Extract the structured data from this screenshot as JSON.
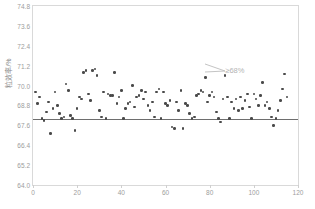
{
  "chart_data": {
    "type": "scatter",
    "title": "",
    "xlabel": "",
    "ylabel": "粒效率/%",
    "xlim": [
      0,
      120
    ],
    "ylim": [
      64.0,
      74.8
    ],
    "grid": false,
    "legend": null,
    "x_ticks": [
      "0",
      "20",
      "40",
      "60",
      "80",
      "100",
      "120"
    ],
    "x_tick_values": [
      0,
      20,
      40,
      60,
      80,
      100,
      120
    ],
    "y_ticks": [
      "64.0",
      "65.2",
      "66.4",
      "67.6",
      "68.8",
      "70.0",
      "71.2",
      "72.4",
      "73.6",
      "74.8"
    ],
    "y_tick_values": [
      64.0,
      65.2,
      66.4,
      67.6,
      68.8,
      70.0,
      71.2,
      72.4,
      73.6,
      74.8
    ],
    "reference_line": {
      "value": 68.0,
      "orientation": "horizontal",
      "label": "≥68%",
      "color": "#6e6e6e"
    },
    "annotations": [
      {
        "text": "≥68%",
        "x": 88,
        "y": 71.0
      }
    ],
    "marker_color": "#4a4a4a",
    "x": [
      1,
      2,
      3,
      4,
      5,
      6,
      7,
      8,
      9,
      10,
      11,
      12,
      13,
      14,
      15,
      16,
      17,
      18,
      19,
      20,
      21,
      22,
      23,
      24,
      25,
      26,
      27,
      28,
      29,
      30,
      31,
      32,
      33,
      34,
      35,
      36,
      37,
      38,
      39,
      40,
      41,
      42,
      43,
      44,
      45,
      46,
      47,
      48,
      49,
      50,
      51,
      52,
      53,
      54,
      55,
      56,
      57,
      58,
      59,
      60,
      61,
      62,
      63,
      64,
      65,
      66,
      67,
      68,
      69,
      70,
      71,
      72,
      73,
      74,
      75,
      76,
      77,
      78,
      79,
      80,
      81,
      82,
      83,
      84,
      85,
      86,
      87,
      88,
      89,
      90,
      91,
      92,
      93,
      94,
      95,
      96,
      97,
      98,
      99,
      100,
      101,
      102,
      103,
      104,
      105,
      106,
      107,
      108,
      109,
      110,
      111,
      112,
      113,
      114,
      115
    ],
    "y": [
      69.6,
      68.9,
      69.3,
      68.0,
      67.9,
      68.4,
      69.0,
      67.1,
      68.6,
      69.6,
      68.8,
      68.3,
      68.0,
      68.1,
      70.1,
      69.7,
      68.2,
      68.0,
      67.3,
      68.6,
      69.3,
      69.2,
      70.8,
      70.9,
      69.5,
      69.1,
      70.9,
      71.0,
      70.6,
      68.5,
      68.1,
      69.6,
      68.0,
      69.5,
      69.4,
      69.4,
      70.8,
      68.9,
      69.3,
      69.7,
      68.0,
      68.6,
      68.9,
      69.0,
      70.0,
      68.7,
      69.3,
      69.4,
      69.7,
      69.2,
      69.6,
      68.8,
      68.5,
      69.0,
      68.1,
      69.6,
      69.8,
      68.0,
      69.6,
      68.9,
      68.8,
      69.1,
      67.5,
      67.4,
      69.0,
      68.5,
      69.7,
      67.4,
      68.9,
      68.8,
      68.3,
      68.0,
      68.1,
      69.4,
      69.5,
      69.7,
      69.6,
      70.5,
      69.0,
      69.4,
      69.6,
      69.3,
      68.4,
      68.0,
      67.8,
      69.2,
      70.6,
      69.3,
      68.0,
      69.0,
      68.6,
      69.2,
      68.5,
      69.3,
      68.6,
      69.1,
      69.5,
      68.7,
      68.0,
      69.5,
      69.2,
      68.8,
      69.4,
      70.2,
      68.8,
      69.0,
      68.6,
      68.1,
      67.6,
      68.0,
      68.5,
      69.1,
      69.8,
      70.7,
      69.3
    ]
  }
}
